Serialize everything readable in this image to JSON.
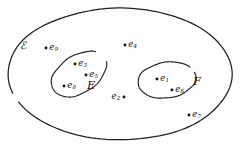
{
  "figure": {
    "type": "euler-diagram",
    "background_color": "#fdfdfd",
    "stroke_color": "#231f1e",
    "point_color": "#151211"
  },
  "regions": [
    {
      "id": "sample-space",
      "label": "ℰ",
      "label_x": 20,
      "label_y": 40,
      "shape": "ellipse",
      "cx": 120,
      "cy": 74,
      "rx": 112,
      "ry": 66,
      "rotation": 0
    },
    {
      "id": "event-e",
      "label": "E",
      "label_x": 87,
      "label_y": 80,
      "shape": "ellipse",
      "cx": 79,
      "cy": 74,
      "rx": 30,
      "ry": 19,
      "rotation": -32
    },
    {
      "id": "event-f",
      "label": "F",
      "label_x": 193,
      "label_y": 76,
      "shape": "ellipse",
      "cx": 167,
      "cy": 80,
      "rx": 29,
      "ry": 18,
      "rotation": -8
    }
  ],
  "points": [
    {
      "id": "e1",
      "base": "e",
      "sub": "1",
      "x": 157,
      "y": 79,
      "label_side": "right",
      "region": "event-f"
    },
    {
      "id": "e2",
      "base": "e",
      "sub": "2",
      "x": 124,
      "y": 97,
      "label_side": "left",
      "region": "sample-space"
    },
    {
      "id": "e3",
      "base": "e",
      "sub": "3",
      "x": 75,
      "y": 64,
      "label_side": "right",
      "region": "event-e"
    },
    {
      "id": "e4",
      "base": "e",
      "sub": "4",
      "x": 125,
      "y": 45,
      "label_side": "right",
      "region": "sample-space"
    },
    {
      "id": "e5",
      "base": "e",
      "sub": "5",
      "x": 86,
      "y": 75,
      "label_side": "right",
      "region": "event-e"
    },
    {
      "id": "e6",
      "base": "e",
      "sub": "6",
      "x": 172,
      "y": 90,
      "label_side": "right",
      "region": "event-f"
    },
    {
      "id": "e7",
      "base": "e",
      "sub": "7",
      "x": 189,
      "y": 115,
      "label_side": "right",
      "region": "sample-space"
    },
    {
      "id": "e8",
      "base": "e",
      "sub": "8",
      "x": 64,
      "y": 86,
      "label_side": "right",
      "region": "event-e"
    },
    {
      "id": "e9",
      "base": "e",
      "sub": "9",
      "x": 46,
      "y": 48,
      "label_side": "right",
      "region": "sample-space"
    }
  ]
}
